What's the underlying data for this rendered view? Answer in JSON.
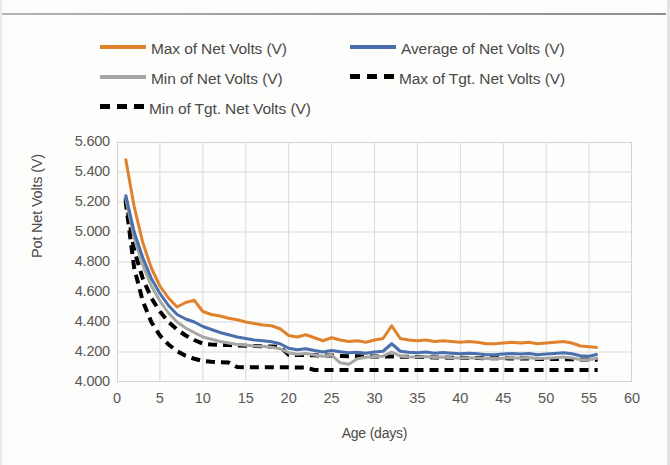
{
  "figure": {
    "background": "#fdfdfc"
  },
  "legend": {
    "position": "top",
    "rows": [
      [
        {
          "label": "Max of Net Volts (V)",
          "color": "#e0822c",
          "style": "solid",
          "name": "legend-item-max-net-volts"
        },
        {
          "label": "Average of Net Volts (V)",
          "color": "#4a6fad",
          "style": "solid",
          "name": "legend-item-average-net-volts"
        }
      ],
      [
        {
          "label": "Min of Net Volts (V)",
          "color": "#a6a6a4",
          "style": "solid",
          "name": "legend-item-min-net-volts"
        },
        {
          "label": "Max of Tgt. Net Volts (V)",
          "color": "#000000",
          "style": "dashed",
          "name": "legend-item-max-tgt-net-volts"
        }
      ],
      [
        {
          "label": "Min of Tgt. Net Volts (V)",
          "color": "#000000",
          "style": "dashed",
          "name": "legend-item-min-tgt-net-volts"
        }
      ]
    ]
  },
  "chart_data": {
    "type": "line",
    "title": "",
    "xlabel": "Age (days)",
    "ylabel": "Pot Net Volts (V)",
    "xlim": [
      0,
      60
    ],
    "ylim": [
      4.0,
      5.6
    ],
    "xticks": [
      0,
      5,
      10,
      15,
      20,
      25,
      30,
      35,
      40,
      45,
      50,
      55,
      60
    ],
    "yticks": [
      4.0,
      4.2,
      4.4,
      4.6,
      4.8,
      5.0,
      5.2,
      5.4,
      5.6
    ],
    "ytick_labels": [
      "4.000",
      "4.200",
      "4.400",
      "4.600",
      "4.800",
      "5.000",
      "5.200",
      "5.400",
      "5.600"
    ],
    "xtick_labels": [
      "0",
      "5",
      "10",
      "15",
      "20",
      "25",
      "30",
      "35",
      "40",
      "45",
      "50",
      "55",
      "60"
    ],
    "grid": true,
    "legend_position": "top",
    "x": [
      1,
      2,
      3,
      4,
      5,
      6,
      7,
      8,
      9,
      10,
      11,
      12,
      13,
      14,
      15,
      16,
      17,
      18,
      19,
      20,
      21,
      22,
      23,
      24,
      25,
      26,
      27,
      28,
      29,
      30,
      31,
      32,
      33,
      34,
      35,
      36,
      37,
      38,
      39,
      40,
      41,
      42,
      43,
      44,
      45,
      46,
      47,
      48,
      49,
      50,
      51,
      52,
      53,
      54,
      55,
      56
    ],
    "series": [
      {
        "name": "Max of Net Volts (V)",
        "color": "#e0822c",
        "style": "solid",
        "width": 3,
        "values": [
          5.49,
          5.17,
          4.93,
          4.76,
          4.64,
          4.56,
          4.5,
          4.53,
          4.545,
          4.47,
          4.45,
          4.44,
          4.425,
          4.415,
          4.4,
          4.39,
          4.38,
          4.375,
          4.355,
          4.31,
          4.3,
          4.315,
          4.295,
          4.275,
          4.295,
          4.28,
          4.27,
          4.275,
          4.265,
          4.28,
          4.29,
          4.375,
          4.29,
          4.28,
          4.275,
          4.28,
          4.27,
          4.275,
          4.27,
          4.265,
          4.27,
          4.265,
          4.255,
          4.255,
          4.26,
          4.265,
          4.26,
          4.265,
          4.255,
          4.26,
          4.265,
          4.27,
          4.26,
          4.24,
          4.235,
          4.23
        ],
        "marker": "none"
      },
      {
        "name": "Average of Net Volts (V)",
        "color": "#4a6fad",
        "style": "solid",
        "width": 3,
        "values": [
          5.25,
          5.0,
          4.83,
          4.69,
          4.59,
          4.51,
          4.45,
          4.42,
          4.4,
          4.37,
          4.35,
          4.33,
          4.315,
          4.3,
          4.29,
          4.28,
          4.275,
          4.268,
          4.255,
          4.225,
          4.215,
          4.222,
          4.21,
          4.2,
          4.21,
          4.202,
          4.195,
          4.198,
          4.192,
          4.2,
          4.205,
          4.255,
          4.205,
          4.198,
          4.195,
          4.2,
          4.192,
          4.196,
          4.192,
          4.188,
          4.192,
          4.188,
          4.182,
          4.182,
          4.186,
          4.19,
          4.186,
          4.19,
          4.182,
          4.186,
          4.19,
          4.195,
          4.188,
          4.175,
          4.172,
          4.185
        ],
        "marker": "none"
      },
      {
        "name": "Min of Net Volts (V)",
        "color": "#a6a6a4",
        "style": "solid",
        "width": 3,
        "values": [
          5.23,
          4.96,
          4.78,
          4.64,
          4.54,
          4.46,
          4.4,
          4.36,
          4.33,
          4.3,
          4.285,
          4.27,
          4.26,
          4.25,
          4.245,
          4.24,
          4.238,
          4.232,
          4.222,
          4.195,
          4.185,
          4.19,
          4.18,
          4.172,
          4.18,
          4.128,
          4.118,
          4.155,
          4.165,
          4.17,
          4.172,
          4.2,
          4.172,
          4.168,
          4.166,
          4.17,
          4.164,
          4.166,
          4.162,
          4.16,
          4.162,
          4.16,
          4.156,
          4.156,
          4.158,
          4.162,
          4.158,
          4.162,
          4.156,
          4.158,
          4.162,
          4.166,
          4.16,
          4.15,
          4.148,
          4.16
        ],
        "marker": "none"
      },
      {
        "name": "Max of Tgt. Net Volts (V)",
        "color": "#000000",
        "style": "dashed",
        "width": 4,
        "values": [
          5.23,
          4.88,
          4.69,
          4.56,
          4.47,
          4.4,
          4.35,
          4.31,
          4.28,
          4.255,
          4.25,
          4.248,
          4.246,
          4.244,
          4.242,
          4.24,
          4.238,
          4.236,
          4.234,
          4.182,
          4.18,
          4.18,
          4.178,
          4.176,
          4.176,
          4.174,
          4.172,
          4.172,
          4.17,
          4.17,
          4.17,
          4.17,
          4.168,
          4.168,
          4.166,
          4.166,
          4.164,
          4.164,
          4.162,
          4.162,
          4.16,
          4.16,
          4.158,
          4.158,
          4.158,
          4.156,
          4.156,
          4.156,
          4.154,
          4.154,
          4.154,
          4.152,
          4.152,
          4.15,
          4.15,
          4.148
        ],
        "marker": "none"
      },
      {
        "name": "Min of Tgt. Net Volts (V)",
        "color": "#000000",
        "style": "dashed",
        "width": 4,
        "values": [
          5.21,
          4.76,
          4.54,
          4.4,
          4.31,
          4.25,
          4.205,
          4.175,
          4.155,
          4.14,
          4.135,
          4.132,
          4.13,
          4.1,
          4.098,
          4.098,
          4.098,
          4.098,
          4.098,
          4.098,
          4.096,
          4.096,
          4.08,
          4.08,
          4.08,
          4.08,
          4.08,
          4.08,
          4.08,
          4.08,
          4.08,
          4.08,
          4.08,
          4.08,
          4.08,
          4.08,
          4.08,
          4.08,
          4.08,
          4.08,
          4.08,
          4.08,
          4.08,
          4.08,
          4.08,
          4.08,
          4.08,
          4.08,
          4.08,
          4.08,
          4.08,
          4.08,
          4.08,
          4.08,
          4.08,
          4.08
        ],
        "marker": "none"
      }
    ]
  }
}
